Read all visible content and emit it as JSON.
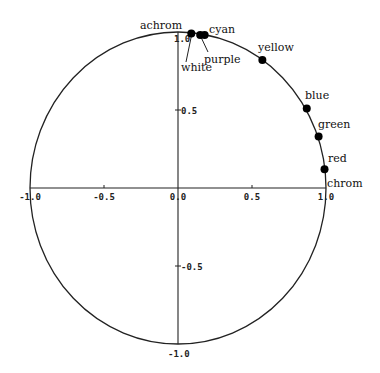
{
  "chart_data": {
    "type": "scatter",
    "title": "",
    "xlabel": "",
    "ylabel": "",
    "xlim": [
      -1.0,
      1.0
    ],
    "ylim": [
      -1.0,
      1.0
    ],
    "grid": false,
    "unit_circle": true,
    "axis_labels": {
      "x_positive": "chrom",
      "y_positive": "achrom"
    },
    "x_ticks": [
      "-1.0",
      "-0.5",
      "0.0",
      "0.5",
      "1.0"
    ],
    "y_ticks": [
      "1.0",
      "0.5",
      "-0.5",
      "-1.0"
    ],
    "points": [
      {
        "label": "white",
        "x": 0.09,
        "y": 0.99
      },
      {
        "label": "purple",
        "x": 0.15,
        "y": 0.98
      },
      {
        "label": "cyan",
        "x": 0.18,
        "y": 0.98
      },
      {
        "label": "yellow",
        "x": 0.57,
        "y": 0.82
      },
      {
        "label": "blue",
        "x": 0.87,
        "y": 0.51
      },
      {
        "label": "green",
        "x": 0.95,
        "y": 0.33
      },
      {
        "label": "red",
        "x": 0.99,
        "y": 0.12
      }
    ]
  },
  "colors": {
    "ink": "#222222",
    "point": "#000000",
    "background": "#ffffff"
  }
}
